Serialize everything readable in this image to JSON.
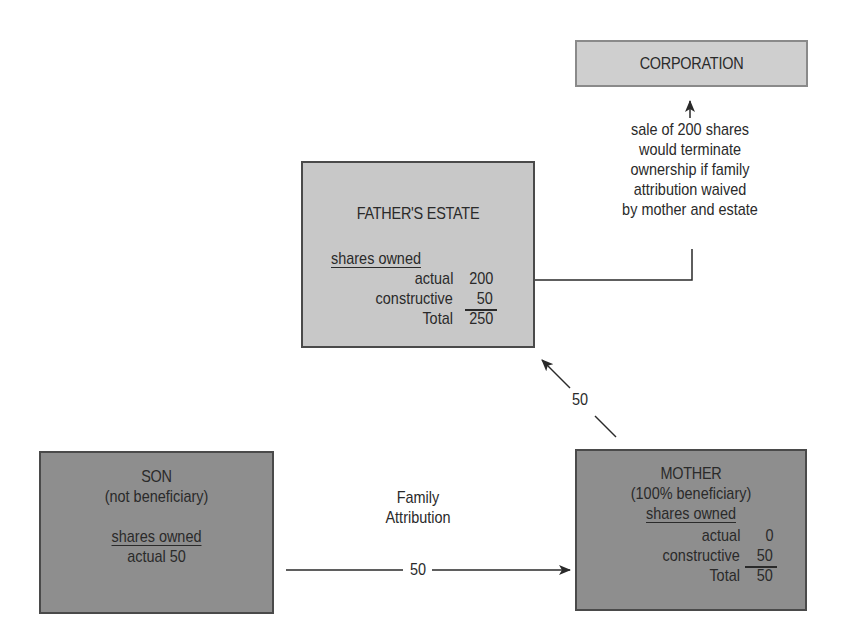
{
  "corporation": {
    "title": "CORPORATION"
  },
  "note": {
    "lines": [
      "sale of 200 shares",
      "would terminate",
      "ownership if family",
      "attribution waived",
      "by mother and estate"
    ]
  },
  "fathers_estate": {
    "title": "FATHER'S ESTATE",
    "shares_heading": "shares owned",
    "rows": [
      {
        "label": "actual",
        "value": "200"
      },
      {
        "label": "constructive",
        "value": "50"
      },
      {
        "label": "Total",
        "value": "250"
      }
    ]
  },
  "son": {
    "title": "SON",
    "subtitle": "(not beneficiary)",
    "shares_heading": "shares owned",
    "actual_line": "actual 50"
  },
  "mother": {
    "title": "MOTHER",
    "subtitle": "(100% beneficiary)",
    "shares_heading": "shares owned",
    "rows": [
      {
        "label": "actual",
        "value": "0"
      },
      {
        "label": "constructive",
        "value": "50"
      },
      {
        "label": "Total",
        "value": "50"
      }
    ]
  },
  "edges": {
    "mother_to_estate_label": "50",
    "family_attribution_label_line1": "Family",
    "family_attribution_label_line2": "Attribution",
    "son_to_mother_label": "50"
  },
  "colors": {
    "light_box": "#c8c8c8",
    "dark_box": "#8e8e8e",
    "border": "#4a4a4a",
    "text": "#2a2a2a"
  }
}
